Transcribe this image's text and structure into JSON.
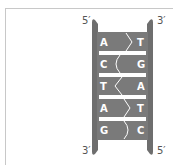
{
  "diagram": {
    "type": "dna-double-strand",
    "strand_labels": {
      "left_top": "5′",
      "right_top": "3′",
      "left_bottom": "3′",
      "right_bottom": "5′"
    },
    "base_pairs": [
      {
        "left": "A",
        "right": "T",
        "bond": "zigzag-right"
      },
      {
        "left": "C",
        "right": "G",
        "bond": "curve-left"
      },
      {
        "left": "T",
        "right": "A",
        "bond": "zigzag-left"
      },
      {
        "left": "A",
        "right": "T",
        "bond": "zigzag-right"
      },
      {
        "left": "G",
        "right": "C",
        "bond": "curve-right"
      }
    ],
    "colors": {
      "backbone": "#6e6e6e",
      "base_fill": "#7a7a7a",
      "separator": "#ffffff",
      "frame": "#c8c8c8",
      "label": "#555555"
    }
  }
}
